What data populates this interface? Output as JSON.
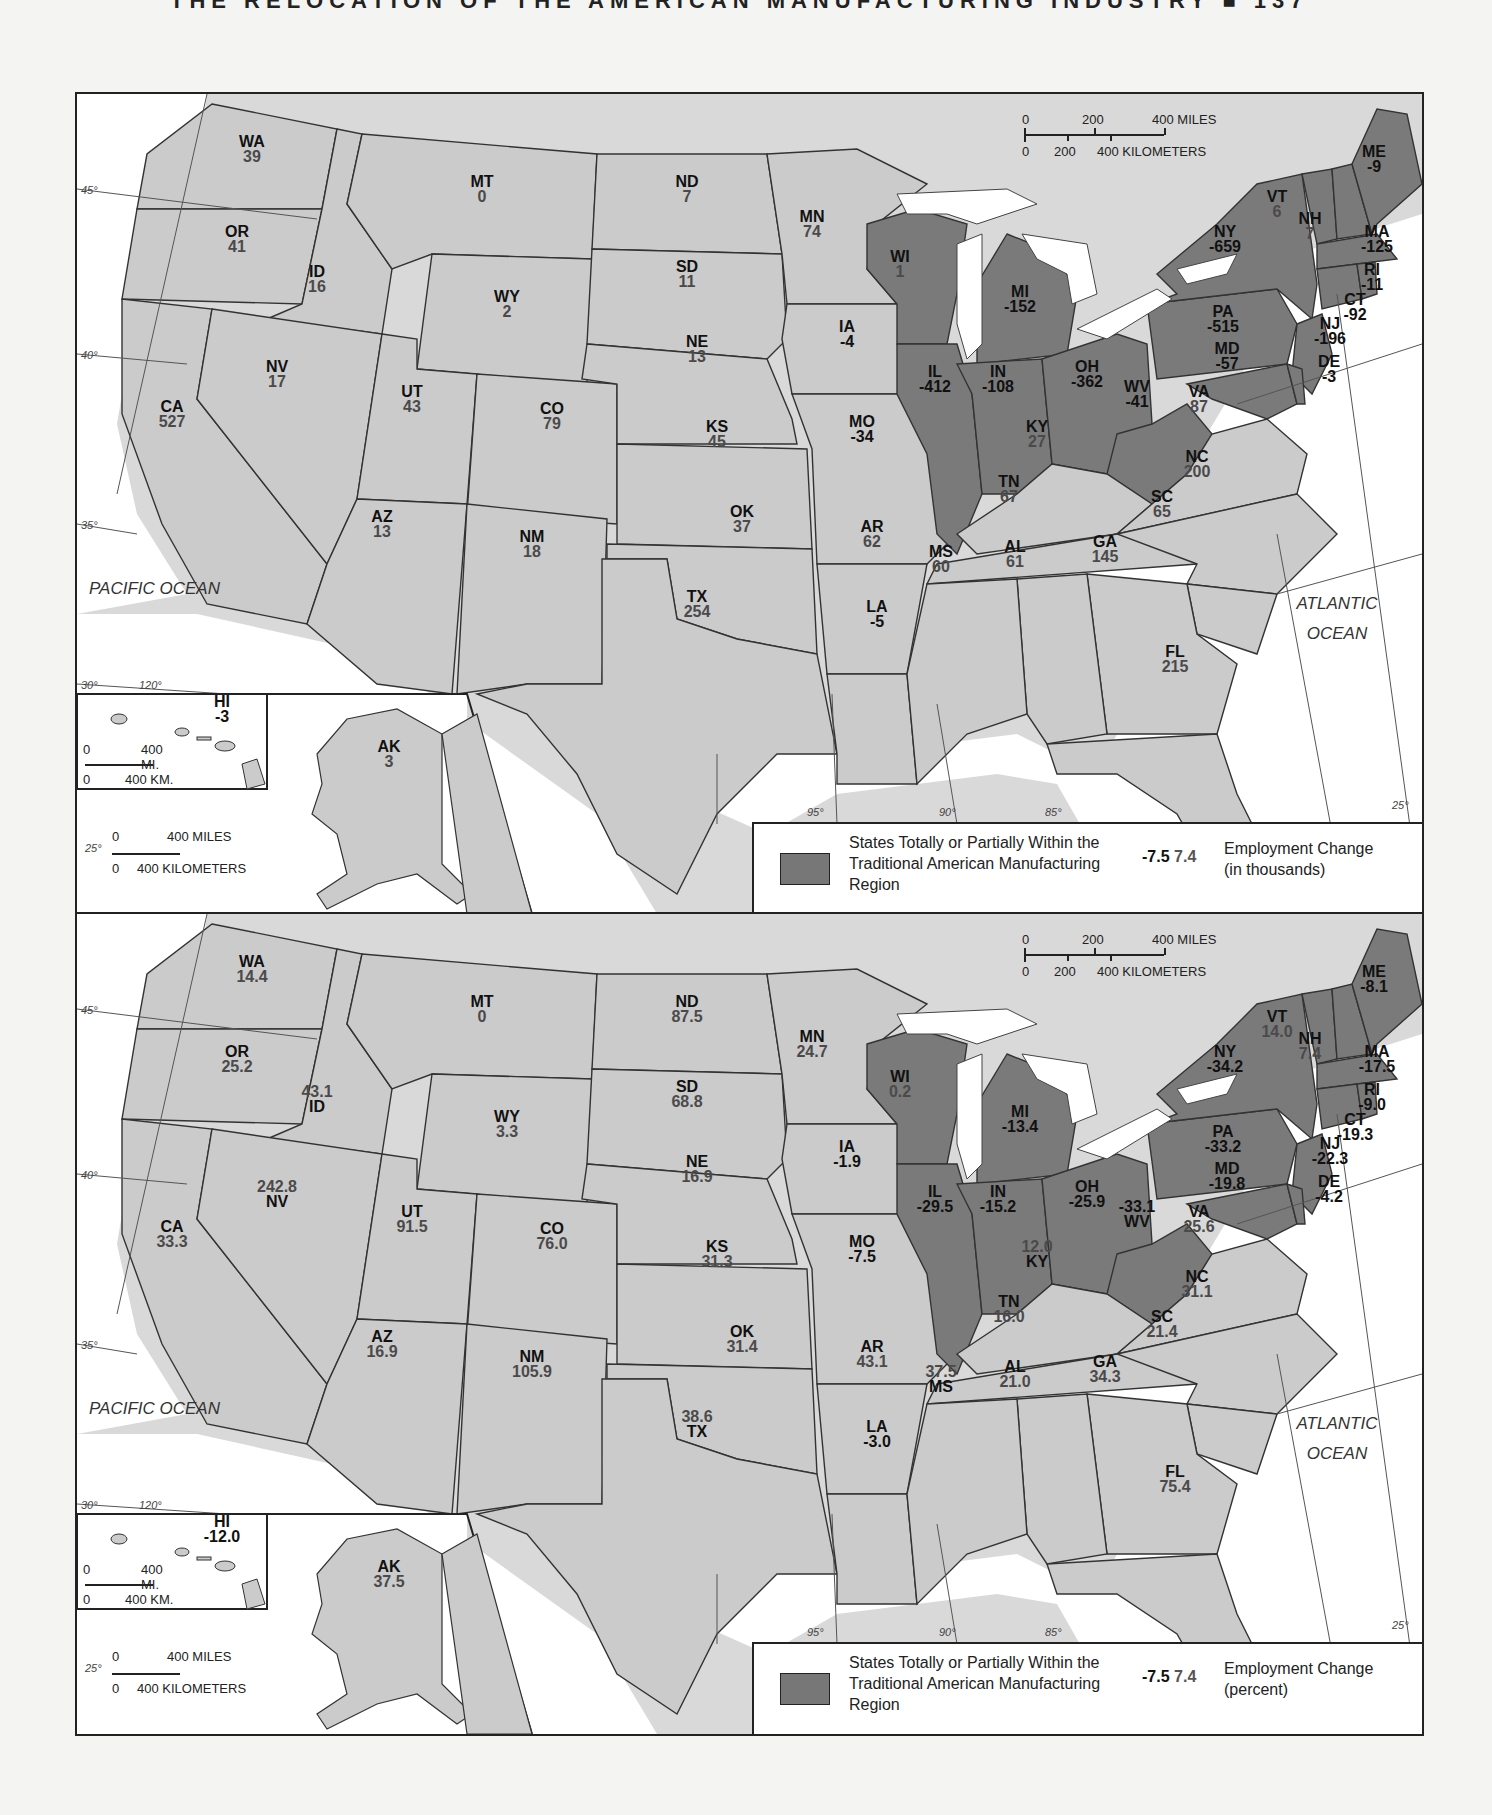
{
  "header": {
    "text": "THE RELOCATION OF THE AMERICAN MANUFACTURING INDUSTRY ■ 137"
  },
  "colors": {
    "manufacturing_region": "#7a7a7a",
    "other_state": "#cbcbcb",
    "water": "#ffffff",
    "negative_value": "#111111",
    "positive_value": "#4a4a4a"
  },
  "oceans": {
    "pacific": "PACIFIC OCEAN",
    "atlantic": "ATLANTIC OCEAN"
  },
  "scale": {
    "main_miles": [
      "0",
      "200",
      "400 MILES"
    ],
    "main_km": [
      "0",
      "200",
      "400 KILOMETERS"
    ],
    "hi_miles": [
      "0",
      "400 MI."
    ],
    "hi_km": [
      "0",
      "400 KM."
    ],
    "ak_miles": [
      "0",
      "400 MILES"
    ],
    "ak_km": [
      "0",
      "400 KILOMETERS"
    ]
  },
  "graticule": {
    "lat": [
      "45°",
      "40°",
      "35°",
      "30°",
      "25°"
    ],
    "lon": [
      "120°",
      "95°",
      "90°",
      "85°"
    ]
  },
  "maps": [
    {
      "id": "thousands",
      "legend": {
        "swatch_label": "States Totally or Partially Within the Traditional American Manufacturing Region",
        "sample_negative": "-7.5",
        "sample_positive": "7.4",
        "title": "Employment Change",
        "unit": "(in thousands)"
      },
      "states": {
        "WA": "39",
        "OR": "41",
        "CA": "527",
        "ID": "16",
        "NV": "17",
        "MT": "0",
        "WY": "2",
        "UT": "43",
        "AZ": "13",
        "CO": "79",
        "NM": "18",
        "ND": "7",
        "SD": "11",
        "NE": "13",
        "KS": "45",
        "OK": "37",
        "TX": "254",
        "MN": "74",
        "IA": "-4",
        "MO": "-34",
        "AR": "62",
        "LA": "-5",
        "WI": "1",
        "IL": "-412",
        "MI": "-152",
        "IN": "-108",
        "OH": "-362",
        "KY": "27",
        "TN": "67",
        "MS": "60",
        "AL": "61",
        "GA": "145",
        "FL": "215",
        "SC": "65",
        "NC": "200",
        "VA": "87",
        "WV": "-41",
        "PA": "-515",
        "NY": "-659",
        "VT": "6",
        "NH": "7",
        "ME": "-9",
        "MA": "-125",
        "RI": "-11",
        "CT": "-92",
        "NJ": "-196",
        "DE": "-3",
        "MD": "-57",
        "HI": "-3",
        "AK": "3"
      }
    },
    {
      "id": "percent",
      "legend": {
        "swatch_label": "States Totally or Partially Within the Traditional American Manufacturing Region",
        "sample_negative": "-7.5",
        "sample_positive": "7.4",
        "title": "Employment Change",
        "unit": "(percent)"
      },
      "states": {
        "WA": "14.4",
        "OR": "25.2",
        "CA": "33.3",
        "ID": "43.1",
        "NV": "242.8",
        "MT": "0",
        "WY": "3.3",
        "UT": "91.5",
        "AZ": "16.9",
        "CO": "76.0",
        "NM": "105.9",
        "ND": "87.5",
        "SD": "68.8",
        "NE": "16.9",
        "KS": "31.3",
        "OK": "31.4",
        "TX": "38.6",
        "MN": "24.7",
        "IA": "-1.9",
        "MO": "-7.5",
        "AR": "43.1",
        "LA": "-3.0",
        "WI": "0.2",
        "IL": "-29.5",
        "MI": "-13.4",
        "IN": "-15.2",
        "OH": "-25.9",
        "KY": "12.0",
        "TN": "16.0",
        "MS": "37.5",
        "AL": "21.0",
        "GA": "34.3",
        "FL": "75.4",
        "SC": "21.4",
        "NC": "31.1",
        "VA": "25.6",
        "WV": "-33.1",
        "PA": "-33.2",
        "NY": "-34.2",
        "VT": "14.0",
        "NH": "7.4",
        "ME": "-8.1",
        "MA": "-17.5",
        "RI": "-9.0",
        "CT": "-19.3",
        "NJ": "-22.3",
        "DE": "-4.2",
        "MD": "-19.8",
        "HI": "-12.0",
        "AK": "37.5"
      }
    }
  ],
  "chart_data": [
    {
      "type": "choropleth",
      "title": "Employment Change (in thousands)",
      "legend": [
        "States Totally or Partially Within the Traditional American Manufacturing Region"
      ],
      "highlighted_states": [
        "WI",
        "IL",
        "MI",
        "IN",
        "OH",
        "WV",
        "PA",
        "NY",
        "VT",
        "NH",
        "ME",
        "MA",
        "RI",
        "CT",
        "NJ",
        "DE",
        "MD"
      ],
      "values": {
        "WA": 39,
        "OR": 41,
        "CA": 527,
        "ID": 16,
        "NV": 17,
        "MT": 0,
        "WY": 2,
        "UT": 43,
        "AZ": 13,
        "CO": 79,
        "NM": 18,
        "ND": 7,
        "SD": 11,
        "NE": 13,
        "KS": 45,
        "OK": 37,
        "TX": 254,
        "MN": 74,
        "IA": -4,
        "MO": -34,
        "AR": 62,
        "LA": -5,
        "WI": 1,
        "IL": -412,
        "MI": -152,
        "IN": -108,
        "OH": -362,
        "KY": 27,
        "TN": 67,
        "MS": 60,
        "AL": 61,
        "GA": 145,
        "FL": 215,
        "SC": 65,
        "NC": 200,
        "VA": 87,
        "WV": -41,
        "PA": -515,
        "NY": -659,
        "VT": 6,
        "NH": 7,
        "ME": -9,
        "MA": -125,
        "RI": -11,
        "CT": -92,
        "NJ": -196,
        "DE": -3,
        "MD": -57,
        "HI": -3,
        "AK": 3
      }
    },
    {
      "type": "choropleth",
      "title": "Employment Change (percent)",
      "legend": [
        "States Totally or Partially Within the Traditional American Manufacturing Region"
      ],
      "highlighted_states": [
        "WI",
        "IL",
        "MI",
        "IN",
        "OH",
        "WV",
        "PA",
        "NY",
        "VT",
        "NH",
        "ME",
        "MA",
        "RI",
        "CT",
        "NJ",
        "DE",
        "MD"
      ],
      "values": {
        "WA": 14.4,
        "OR": 25.2,
        "CA": 33.3,
        "ID": 43.1,
        "NV": 242.8,
        "MT": 0,
        "WY": 3.3,
        "UT": 91.5,
        "AZ": 16.9,
        "CO": 76.0,
        "NM": 105.9,
        "ND": 87.5,
        "SD": 68.8,
        "NE": 16.9,
        "KS": 31.3,
        "OK": 31.4,
        "TX": 38.6,
        "MN": 24.7,
        "IA": -1.9,
        "MO": -7.5,
        "AR": 43.1,
        "LA": -3.0,
        "WI": 0.2,
        "IL": -29.5,
        "MI": -13.4,
        "IN": -15.2,
        "OH": -25.9,
        "KY": 12.0,
        "TN": 16.0,
        "MS": 37.5,
        "AL": 21.0,
        "GA": 34.3,
        "FL": 75.4,
        "SC": 21.4,
        "NC": 31.1,
        "VA": 25.6,
        "WV": -33.1,
        "PA": -33.2,
        "NY": -34.2,
        "VT": 14.0,
        "NH": 7.4,
        "ME": -8.1,
        "MA": -17.5,
        "RI": -9.0,
        "CT": -19.3,
        "NJ": -22.3,
        "DE": -4.2,
        "MD": -19.8,
        "HI": -12.0,
        "AK": 37.5
      }
    }
  ]
}
